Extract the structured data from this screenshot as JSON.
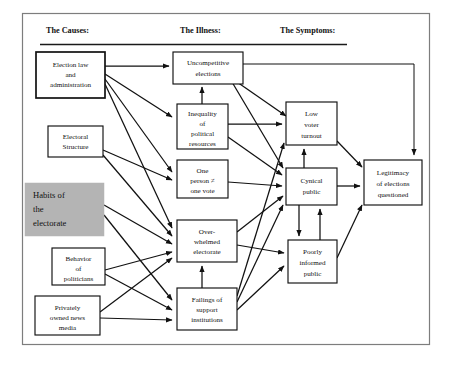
{
  "diagram": {
    "headers": [
      {
        "id": "causes",
        "label": "The Causes:"
      },
      {
        "id": "illness",
        "label": "The Illness:"
      },
      {
        "id": "symptoms",
        "label": "The Symptoms:"
      }
    ],
    "colors": {
      "box_fill": "#ffffff",
      "box_stroke": "#111111",
      "shaded_fill": "#b4b4b4",
      "frame_stroke": "#7d7d7d",
      "text": "#111111"
    },
    "nodes": [
      {
        "id": "election-law",
        "column": "causes",
        "label": "Election law and administration",
        "lines": [
          "Election law",
          "and",
          "administration"
        ],
        "shaded": false
      },
      {
        "id": "electoral-structure",
        "column": "causes",
        "label": "Electoral Structure",
        "lines": [
          "Electoral",
          "Structure"
        ],
        "shaded": false
      },
      {
        "id": "habits-electorate",
        "column": "causes",
        "label": "Habits of the electorate",
        "lines": [
          "Habits of",
          "the",
          "electorate"
        ],
        "shaded": true
      },
      {
        "id": "behavior-politicians",
        "column": "causes",
        "label": "Behavior of politicians",
        "lines": [
          "Behavior",
          "of",
          "politicians"
        ],
        "shaded": false
      },
      {
        "id": "news-media",
        "column": "causes",
        "label": "Privately owned news media",
        "lines": [
          "Privately",
          "owned news",
          "media"
        ],
        "shaded": false
      },
      {
        "id": "uncompetitive-elections",
        "column": "illness",
        "label": "Uncompetitive elections",
        "lines": [
          "Uncompetitive",
          "elections"
        ],
        "shaded": false
      },
      {
        "id": "inequality-resources",
        "column": "illness",
        "label": "Inequality of political resources",
        "lines": [
          "Inequality",
          "of",
          "political",
          "resources"
        ],
        "shaded": false
      },
      {
        "id": "one-person-one-vote",
        "column": "illness",
        "label": "One person ≠ one vote",
        "lines": [
          "One",
          "person ≠",
          "one vote"
        ],
        "shaded": false
      },
      {
        "id": "overwhelmed-electorate",
        "column": "illness",
        "label": "Over-whelmed electorate",
        "lines": [
          "Over-",
          "whelmed",
          "electorate"
        ],
        "shaded": false
      },
      {
        "id": "failings-support",
        "column": "illness",
        "label": "Failings of support institutions",
        "lines": [
          "Failings of",
          "support",
          "institutions"
        ],
        "shaded": false
      },
      {
        "id": "low-voter-turnout",
        "column": "symptoms",
        "label": "Low voter turnout",
        "lines": [
          "Low",
          "voter",
          "turnout"
        ],
        "shaded": false
      },
      {
        "id": "cynical-public",
        "column": "symptoms",
        "label": "Cynical public",
        "lines": [
          "Cynical",
          "public"
        ],
        "shaded": false
      },
      {
        "id": "poorly-informed-public",
        "column": "symptoms",
        "label": "Poorly informed public",
        "lines": [
          "Poorly",
          "informed",
          "public"
        ],
        "shaded": false
      },
      {
        "id": "legitimacy-questioned",
        "column": "symptoms",
        "label": "Legitimacy of elections questioned",
        "lines": [
          "Legitimacy",
          "of elections",
          "questioned"
        ],
        "shaded": false
      }
    ],
    "edges": [
      {
        "from": "election-law",
        "to": "uncompetitive-elections"
      },
      {
        "from": "election-law",
        "to": "inequality-resources"
      },
      {
        "from": "election-law",
        "to": "one-person-one-vote"
      },
      {
        "from": "election-law",
        "to": "overwhelmed-electorate"
      },
      {
        "from": "electoral-structure",
        "to": "one-person-one-vote"
      },
      {
        "from": "electoral-structure",
        "to": "overwhelmed-electorate"
      },
      {
        "from": "habits-electorate",
        "to": "overwhelmed-electorate"
      },
      {
        "from": "habits-electorate",
        "to": "failings-support"
      },
      {
        "from": "behavior-politicians",
        "to": "overwhelmed-electorate"
      },
      {
        "from": "behavior-politicians",
        "to": "failings-support"
      },
      {
        "from": "news-media",
        "to": "overwhelmed-electorate"
      },
      {
        "from": "news-media",
        "to": "failings-support"
      },
      {
        "from": "inequality-resources",
        "to": "uncompetitive-elections"
      },
      {
        "from": "inequality-resources",
        "to": "low-voter-turnout"
      },
      {
        "from": "inequality-resources",
        "to": "cynical-public"
      },
      {
        "from": "uncompetitive-elections",
        "to": "low-voter-turnout"
      },
      {
        "from": "uncompetitive-elections",
        "to": "cynical-public"
      },
      {
        "from": "uncompetitive-elections",
        "to": "legitimacy-questioned"
      },
      {
        "from": "one-person-one-vote",
        "to": "cynical-public"
      },
      {
        "from": "overwhelmed-electorate",
        "to": "cynical-public"
      },
      {
        "from": "overwhelmed-electorate",
        "to": "poorly-informed-public"
      },
      {
        "from": "failings-support",
        "to": "overwhelmed-electorate"
      },
      {
        "from": "failings-support",
        "to": "low-voter-turnout"
      },
      {
        "from": "failings-support",
        "to": "cynical-public"
      },
      {
        "from": "failings-support",
        "to": "poorly-informed-public"
      },
      {
        "from": "cynical-public",
        "to": "low-voter-turnout"
      },
      {
        "from": "cynical-public",
        "to": "poorly-informed-public"
      },
      {
        "from": "poorly-informed-public",
        "to": "cynical-public"
      },
      {
        "from": "cynical-public",
        "to": "legitimacy-questioned"
      },
      {
        "from": "low-voter-turnout",
        "to": "legitimacy-questioned"
      },
      {
        "from": "poorly-informed-public",
        "to": "legitimacy-questioned"
      }
    ]
  }
}
